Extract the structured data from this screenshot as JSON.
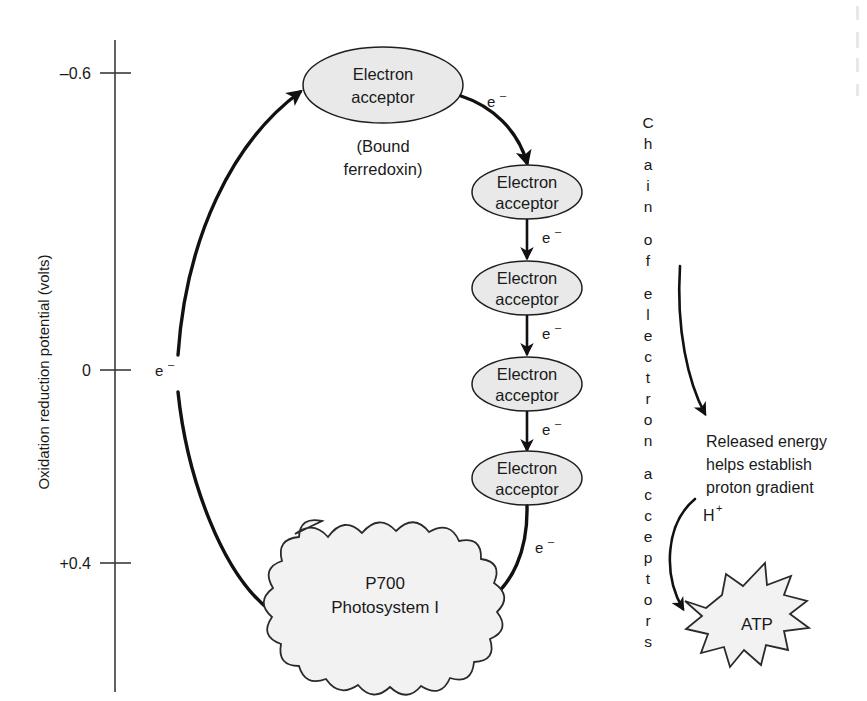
{
  "diagram": {
    "axis": {
      "label": "Oxidation reduction potential (volts)",
      "ticks": [
        {
          "value": "-0.6",
          "display": "–0.6",
          "y": 73
        },
        {
          "value": "0",
          "display": "0",
          "y": 370
        },
        {
          "value": "+0.4",
          "display": "+0.4",
          "y": 563
        }
      ]
    },
    "nodes": {
      "bound_ferredoxin": {
        "line1": "Electron",
        "line2": "acceptor",
        "sub_line1": "(Bound",
        "sub_line2": "ferredoxin)"
      },
      "acceptor_chain": [
        {
          "line1": "Electron",
          "line2": "acceptor"
        },
        {
          "line1": "Electron",
          "line2": "acceptor"
        },
        {
          "line1": "Electron",
          "line2": "acceptor"
        },
        {
          "line1": "Electron",
          "line2": "acceptor"
        }
      ],
      "photosystem": {
        "line1": "P700",
        "line2": "Photosystem I"
      },
      "atp": {
        "label": "ATP"
      }
    },
    "electron_labels": [
      {
        "id": "e-left",
        "base": "e",
        "sup": "–"
      },
      {
        "id": "e-top-right",
        "base": "e",
        "sup": "–"
      },
      {
        "id": "e-chain-1",
        "base": "e",
        "sup": "–"
      },
      {
        "id": "e-chain-2",
        "base": "e",
        "sup": "–"
      },
      {
        "id": "e-chain-3",
        "base": "e",
        "sup": "–"
      },
      {
        "id": "e-bottom",
        "base": "e",
        "sup": "–"
      }
    ],
    "vertical_caption": {
      "text": "Chain of electron acceptors",
      "letters": [
        "C",
        "h",
        "a",
        "i",
        "n",
        "",
        "o",
        "f",
        "",
        "e",
        "l",
        "e",
        "c",
        "t",
        "r",
        "o",
        "n",
        "",
        "a",
        "c",
        "c",
        "e",
        "p",
        "t",
        "o",
        "r",
        "s"
      ]
    },
    "released_energy": {
      "line1": "Released energy",
      "line2": "helps establish",
      "line3": "proton gradient"
    },
    "proton": {
      "base": "H",
      "sup": "+"
    },
    "colors": {
      "node_fill": "#e9e9e9",
      "blob_fill": "#f2f2f2",
      "stroke": "#1a1a1a",
      "axis": "#3a3a3a",
      "background": "#ffffff"
    }
  }
}
